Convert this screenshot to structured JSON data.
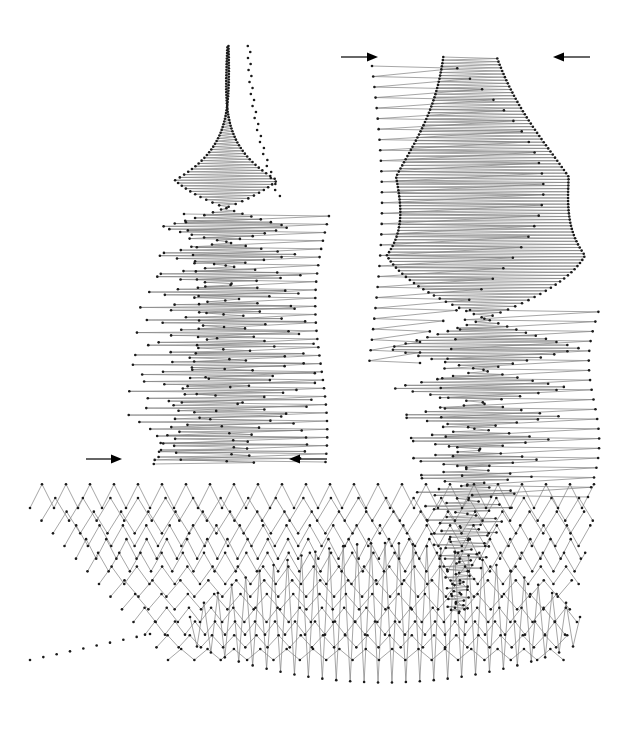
{
  "figure": {
    "background_color": "#ffffff",
    "width": 624,
    "height": 736,
    "line_color": "#808080",
    "line_width": 0.7,
    "marker_color": "#1a1a1a",
    "marker_radius": 1.3,
    "arrow_color": "#000000"
  },
  "annotations": {
    "arrows": [
      {
        "name": "top-left-arrow-right",
        "direction": "right",
        "x1": 341,
        "y1": 57,
        "x2": 378,
        "y2": 57
      },
      {
        "name": "top-right-arrow-left",
        "direction": "left",
        "x1": 590,
        "y1": 57,
        "x2": 553,
        "y2": 57
      },
      {
        "name": "mid-left-arrow-right",
        "direction": "right",
        "x1": 86,
        "y1": 459,
        "x2": 122,
        "y2": 459
      },
      {
        "name": "mid-right-arrow-left",
        "direction": "left",
        "x1": 327,
        "y1": 459,
        "x2": 289,
        "y2": 459
      }
    ]
  },
  "chart_data": {
    "type": "line",
    "subtitle": "",
    "xlabel": "",
    "ylabel": "",
    "xlim": [
      0,
      624
    ],
    "ylim": [
      736,
      0
    ],
    "grid": false,
    "legend": "none",
    "axes_visible": false,
    "tick_labels_x": [],
    "tick_labels_y": [],
    "annotations": [],
    "panels": [
      {
        "name": "panel-top-left",
        "x_range": [
          120,
          330
        ],
        "y_range": [
          45,
          470
        ],
        "rows": 48,
        "period_px": 52,
        "description": "Left upper lobe: rows of sawtooth sampled points whose horizontal span widens downward then narrows; long shallow strokes appear on the right side of the lobe."
      },
      {
        "name": "panel-top-right",
        "x_range": [
          370,
          595
        ],
        "y_range": [
          55,
          620
        ],
        "rows": 56,
        "period_px": 52,
        "description": "Right upper lobe: mirrored sawtooth rows with long shallow strokes on the left side near the top, transitioning to dense zigzag toward the bottom."
      },
      {
        "name": "panel-bottom",
        "x_range": [
          30,
          600
        ],
        "y_range": [
          500,
          710
        ],
        "rows": 22,
        "period_px": 52,
        "description": "Bottom lobe: wide band of zigzag rows with a central burst of tall narrow spikes (aliasing beat pattern)."
      }
    ],
    "series": [
      {
        "name": "trajectory-top-left",
        "values": []
      },
      {
        "name": "trajectory-top-right",
        "values": []
      },
      {
        "name": "trajectory-bottom",
        "values": []
      }
    ],
    "generator": {
      "kind": "sampled-sawtooth-sweep",
      "notes": "Connected polyline through regularly sampled points; sampling rate sweeps relative to the signal period producing aliased zigzag and long-stroke regions."
    }
  }
}
